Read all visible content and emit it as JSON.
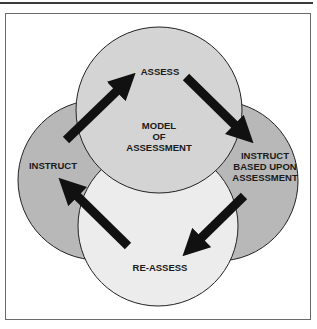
{
  "diagram": {
    "title": "Model of Assessment",
    "center_label": [
      "MODEL",
      "OF",
      "ASSESSMENT"
    ],
    "nodes": [
      {
        "id": "assess",
        "label": [
          "ASSESS"
        ],
        "position": "top",
        "color": "#d4d4d4"
      },
      {
        "id": "instruct-based",
        "label": [
          "INSTRUCT",
          "BASED UPON",
          "ASSESSMENT"
        ],
        "position": "right",
        "color": "#b8b8b8"
      },
      {
        "id": "re-assess",
        "label": [
          "RE-ASSESS"
        ],
        "position": "bottom",
        "color": "#ececec"
      },
      {
        "id": "instruct",
        "label": [
          "INSTRUCT"
        ],
        "position": "left",
        "color": "#b8b8b8"
      }
    ],
    "edges": [
      {
        "from": "instruct",
        "to": "assess"
      },
      {
        "from": "assess",
        "to": "instruct-based"
      },
      {
        "from": "instruct-based",
        "to": "re-assess"
      },
      {
        "from": "re-assess",
        "to": "instruct"
      }
    ]
  }
}
